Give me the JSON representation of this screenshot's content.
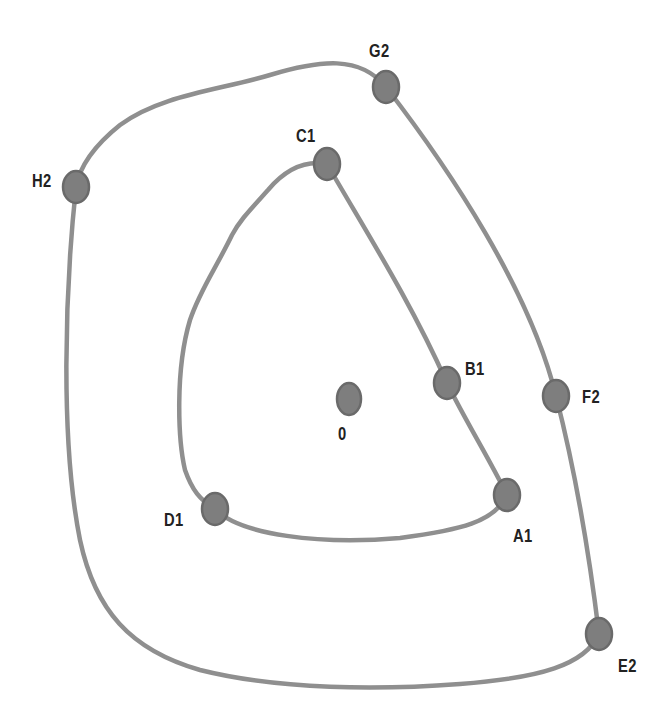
{
  "colors": {
    "background": "#ffffff",
    "curve": "#8f8f8f",
    "node_fill": "#7e7e7e",
    "node_stroke": "#6a6a6a",
    "label": "#222222"
  },
  "center": {
    "label": "0",
    "x": 349,
    "y": 399
  },
  "inner_loop": {
    "name": "loop-1",
    "nodes": [
      {
        "id": "A1",
        "label": "A1",
        "x": 507,
        "y": 495
      },
      {
        "id": "B1",
        "label": "B1",
        "x": 447,
        "y": 383
      },
      {
        "id": "C1",
        "label": "C1",
        "x": 327,
        "y": 164
      },
      {
        "id": "D1",
        "label": "D1",
        "x": 215,
        "y": 509
      }
    ]
  },
  "outer_loop": {
    "name": "loop-2",
    "nodes": [
      {
        "id": "E2",
        "label": "E2",
        "x": 599,
        "y": 634
      },
      {
        "id": "F2",
        "label": "F2",
        "x": 556,
        "y": 396
      },
      {
        "id": "G2",
        "label": "G2",
        "x": 386,
        "y": 87
      },
      {
        "id": "H2",
        "label": "H2",
        "x": 76,
        "y": 187
      }
    ]
  },
  "labels": {
    "A1": "A1",
    "B1": "B1",
    "C1": "C1",
    "D1": "D1",
    "E2": "E2",
    "F2": "F2",
    "G2": "G2",
    "H2": "H2",
    "O": "0"
  }
}
